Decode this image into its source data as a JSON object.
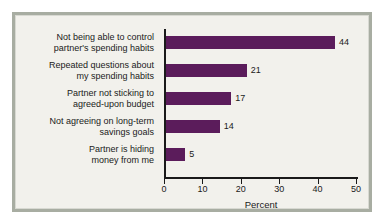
{
  "chart_data": {
    "type": "bar",
    "orientation": "horizontal",
    "title": "",
    "xlabel": "Percent",
    "ylabel": "",
    "xlim": [
      0,
      50
    ],
    "xticks": [
      0,
      10,
      20,
      30,
      40,
      50
    ],
    "xtick_labels": [
      "0",
      "10",
      "20",
      "30",
      "40",
      "50"
    ],
    "grid": false,
    "legend": null,
    "bar_color": "#5b1c5b",
    "categories": [
      "Not being able to control partner's spending habits",
      "Repeated questions about my spending habits",
      "Partner not sticking to agreed-upon budget",
      "Not agreeing on long-term savings goals",
      "Partner is hiding money from me"
    ],
    "values": [
      44,
      21,
      17,
      14,
      5
    ],
    "value_labels": [
      "44",
      "21",
      "17",
      "14",
      "5"
    ]
  },
  "rows": [
    {
      "line1": "Not being able to control",
      "line2": "partner's spending habits",
      "value": 44,
      "value_label": "44"
    },
    {
      "line1": "Repeated questions about",
      "line2": "my spending habits",
      "value": 21,
      "value_label": "21"
    },
    {
      "line1": "Partner not sticking to",
      "line2": "agreed-upon budget",
      "value": 17,
      "value_label": "17"
    },
    {
      "line1": "Not agreeing on long-term",
      "line2": "savings goals",
      "value": 14,
      "value_label": "14"
    },
    {
      "line1": "Partner is hiding",
      "line2": "money from me",
      "value": 5,
      "value_label": "5"
    }
  ],
  "axis": {
    "title": "Percent",
    "ticks": [
      "0",
      "10",
      "20",
      "30",
      "40",
      "50"
    ]
  }
}
